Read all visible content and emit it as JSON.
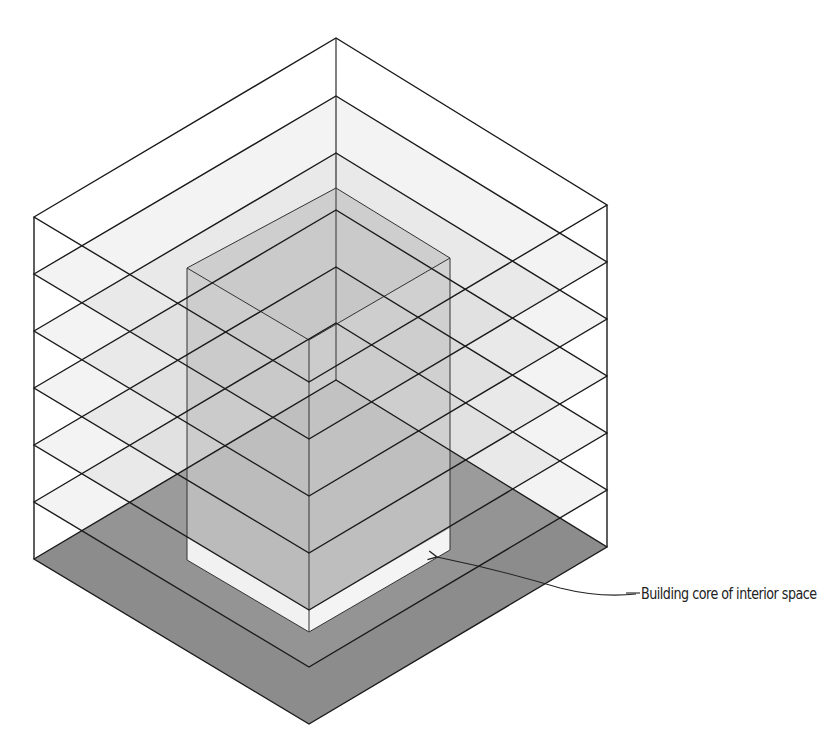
{
  "diagram": {
    "type": "isometric-building-section",
    "floors": 6,
    "floor_planes": 7,
    "callout": {
      "label": "Building core of interior space",
      "target": "building-core"
    },
    "colors": {
      "line": "#1a1a1a",
      "ground": "#8a8a8a",
      "floor_tint": "#d0d0d0",
      "core_face": "#c4c4c4",
      "core_base": "#efefef",
      "background": "#ffffff"
    }
  }
}
